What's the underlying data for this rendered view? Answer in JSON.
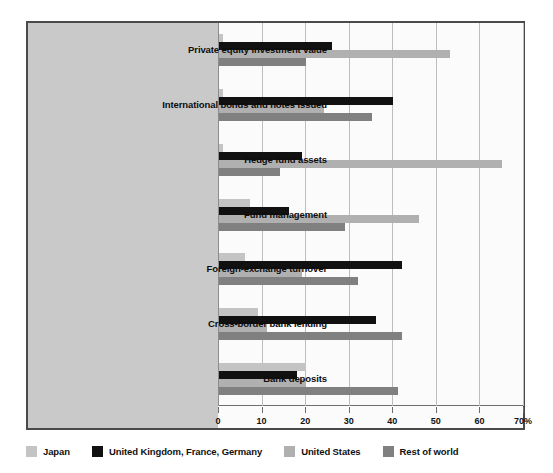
{
  "chart_data": {
    "type": "bar",
    "orientation": "horizontal",
    "title": "",
    "xlabel": "",
    "ylabel": "",
    "xlim": [
      0,
      70
    ],
    "xticks": [
      0,
      10,
      20,
      30,
      40,
      50,
      60,
      70
    ],
    "xtick_labels": [
      "0",
      "10",
      "20",
      "30",
      "40",
      "50",
      "60",
      "70%"
    ],
    "grid": true,
    "legend_position": "bottom-left",
    "categories": [
      "Private equity investment value",
      "International bonds and notes issued",
      "Hedge fund assets",
      "Fund management",
      "Foreign-exchange turnover",
      "Cross-border bank lending",
      "Bank deposits"
    ],
    "series": [
      {
        "name": "Japan",
        "color": "#c4c4c4",
        "values": [
          1,
          1,
          1,
          7,
          6,
          9,
          20
        ]
      },
      {
        "name": "United Kingdom, France, Germany",
        "color": "#111111",
        "values": [
          26,
          40,
          19,
          16,
          42,
          36,
          18
        ]
      },
      {
        "name": "United States",
        "color": "#b0b0b0",
        "values": [
          53,
          24,
          65,
          46,
          19,
          11,
          20
        ]
      },
      {
        "name": "Rest of world",
        "color": "#808080",
        "values": [
          20,
          35,
          14,
          29,
          32,
          42,
          41
        ]
      }
    ]
  },
  "colors": {
    "panel_border": "#4a4a4a",
    "label_band": "#c9c9c9",
    "plot_background": "#fbfbfb",
    "gridline": "#bdbdbd",
    "axis": "#6d6d6d"
  }
}
